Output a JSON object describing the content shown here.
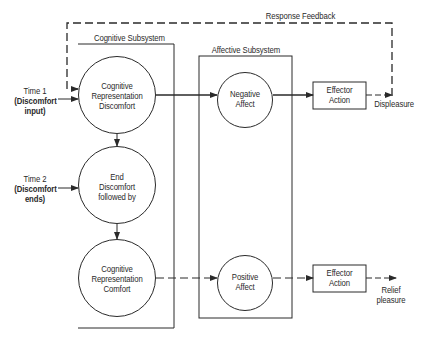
{
  "feedback": {
    "label": "Response Feedback"
  },
  "cognitive_subsystem": {
    "label": "Cognitive Subsystem",
    "nodes": [
      {
        "id": "cog-discomfort",
        "lines": [
          "Cognitive",
          "Representation",
          "Discomfort"
        ]
      },
      {
        "id": "end-discomfort",
        "lines": [
          "End",
          "Discomfort",
          "followed by"
        ]
      },
      {
        "id": "cog-comfort",
        "lines": [
          "Cognitive",
          "Representation",
          "Comfort"
        ]
      }
    ]
  },
  "affective_subsystem": {
    "label": "Affective Subsystem",
    "nodes": [
      {
        "id": "negative-affect",
        "lines": [
          "Negative",
          "Affect"
        ]
      },
      {
        "id": "positive-affect",
        "lines": [
          "Positive",
          "Affect"
        ]
      }
    ]
  },
  "effectors": [
    {
      "id": "effector-1",
      "lines": [
        "Effector",
        "Action"
      ],
      "output": [
        "Displeasure"
      ]
    },
    {
      "id": "effector-2",
      "lines": [
        "Effector",
        "Action"
      ],
      "output": [
        "Relief",
        "pleasure"
      ]
    }
  ],
  "inputs": [
    {
      "id": "time1",
      "lines": [
        "Time 1",
        "(Discomfort",
        "input)"
      ]
    },
    {
      "id": "time2",
      "lines": [
        "Time 2",
        "(Discomfort",
        "ends)"
      ]
    }
  ],
  "colors": {
    "line": "#2a2a2a",
    "background": "#ffffff"
  }
}
